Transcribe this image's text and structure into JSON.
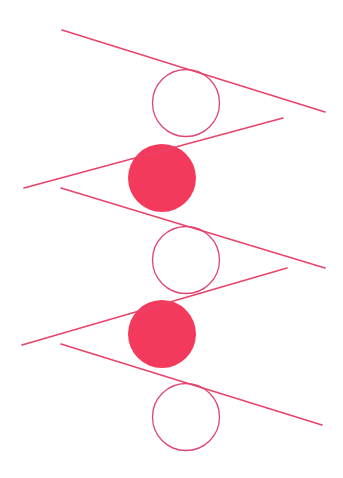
{
  "artwork": {
    "title": "Abstract geometric composition: zigzag lines with alternating circles",
    "width": 343,
    "height": 478,
    "background_color": "#FFFFFF",
    "stroke_color": "#E8436A",
    "fill_color": "#F43A5C",
    "stroke_width": 1.6,
    "circle_stroke_width": 1.3
  },
  "circles": [
    {
      "name": "circle-1-outline",
      "style": "outline",
      "cx": 186,
      "cy": 103,
      "r": 33.5,
      "fill": "none",
      "stroke": "#DE4573"
    },
    {
      "name": "circle-2-filled",
      "style": "filled",
      "cx": 162,
      "cy": 178,
      "r": 34.0,
      "fill": "#F43A5C",
      "stroke": "none"
    },
    {
      "name": "circle-3-outline",
      "style": "outline",
      "cx": 186,
      "cy": 260,
      "r": 33.5,
      "fill": "none",
      "stroke": "#DE4573"
    },
    {
      "name": "circle-4-filled",
      "style": "filled",
      "cx": 162,
      "cy": 334,
      "r": 34.0,
      "fill": "#F43A5C",
      "stroke": "none"
    },
    {
      "name": "circle-5-outline",
      "style": "outline",
      "cx": 186,
      "cy": 417,
      "r": 33.5,
      "fill": "none",
      "stroke": "#DE4573"
    }
  ],
  "lines": [
    {
      "name": "line-1-down-right",
      "x1": 62,
      "y1": 30,
      "x2": 325,
      "y2": 112,
      "stroke": "#E8436A"
    },
    {
      "name": "line-2-down-left",
      "x1": 283,
      "y1": 118,
      "x2": 24,
      "y2": 188,
      "stroke": "#E8436A"
    },
    {
      "name": "line-3-down-right",
      "x1": 61,
      "y1": 188,
      "x2": 325,
      "y2": 268,
      "stroke": "#E8436A"
    },
    {
      "name": "line-4-down-left",
      "x1": 287,
      "y1": 268,
      "x2": 22,
      "y2": 345,
      "stroke": "#E8436A"
    },
    {
      "name": "line-5-down-right",
      "x1": 61,
      "y1": 344,
      "x2": 322,
      "y2": 425,
      "stroke": "#E8436A"
    }
  ]
}
